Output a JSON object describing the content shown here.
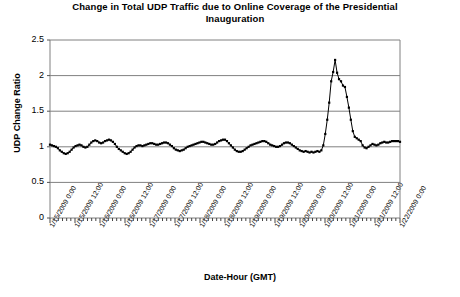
{
  "chart_data": {
    "type": "line",
    "title": "Change in Total UDP Traffic due to Online Coverage of the Presidential Inauguration",
    "title_line1": "Change in Total UDP Traffic due to Online Coverage of the Presidential",
    "title_line2": "Inauguration",
    "xlabel": "Date-Hour (GMT)",
    "ylabel": "UDP Change Ratio",
    "ylim": [
      0,
      2.5
    ],
    "ytick_labels": [
      "0",
      "0.5",
      "1",
      "1.5",
      "2",
      "2.5"
    ],
    "ytick_values": [
      0,
      0.5,
      1,
      1.5,
      2,
      2.5
    ],
    "grid": "horizontal",
    "legend": "none",
    "marker": "filled-diamond",
    "line_color": "#000000",
    "grid_color": "#808080",
    "axis_color": "#808080",
    "xtick_labels": [
      "1/15/2009 0:00",
      "1/15/2009 12:00",
      "1/16/2009 0:00",
      "1/16/2009 12:00",
      "1/17/2009 0:00",
      "1/17/2009 12:00",
      "1/18/2009 0:00",
      "1/18/2009 12:00",
      "1/19/2009 0:00",
      "1/19/2009 12:00",
      "1/20/2009 0:00",
      "1/20/2009 12:00",
      "1/21/2009 0:00",
      "1/21/2009 12:00",
      "1/22/2009 0:00"
    ],
    "xlim_hours": [
      0,
      168
    ],
    "xtick_interval_hours": 12,
    "minor_tick_interval_hours": 2,
    "x_start": "1/15/2009 0:00",
    "x_end": "1/22/2009 0:00",
    "peak": {
      "x_label": "1/20/2009 ~17:00",
      "value": 2.22
    },
    "baseline_value": 1.0,
    "values": [
      1.03,
      1.02,
      1.01,
      1.0,
      0.98,
      0.95,
      0.93,
      0.91,
      0.9,
      0.91,
      0.93,
      0.96,
      0.99,
      1.01,
      1.02,
      1.03,
      1.02,
      1.0,
      0.99,
      1.0,
      1.03,
      1.06,
      1.08,
      1.09,
      1.08,
      1.06,
      1.05,
      1.06,
      1.08,
      1.09,
      1.1,
      1.09,
      1.07,
      1.04,
      1.0,
      0.97,
      0.95,
      0.93,
      0.91,
      0.9,
      0.91,
      0.93,
      0.96,
      0.99,
      1.01,
      1.02,
      1.02,
      1.01,
      1.02,
      1.03,
      1.04,
      1.05,
      1.05,
      1.04,
      1.03,
      1.03,
      1.04,
      1.05,
      1.06,
      1.06,
      1.05,
      1.03,
      1.01,
      0.98,
      0.96,
      0.95,
      0.94,
      0.95,
      0.96,
      0.98,
      1.0,
      1.01,
      1.02,
      1.03,
      1.04,
      1.05,
      1.06,
      1.07,
      1.07,
      1.06,
      1.05,
      1.04,
      1.03,
      1.03,
      1.04,
      1.06,
      1.08,
      1.09,
      1.1,
      1.1,
      1.08,
      1.05,
      1.02,
      0.99,
      0.96,
      0.94,
      0.93,
      0.93,
      0.94,
      0.96,
      0.98,
      1.0,
      1.02,
      1.03,
      1.04,
      1.05,
      1.06,
      1.07,
      1.08,
      1.08,
      1.07,
      1.05,
      1.03,
      1.02,
      1.01,
      1.0,
      1.0,
      1.01,
      1.03,
      1.05,
      1.06,
      1.06,
      1.05,
      1.03,
      1.01,
      0.99,
      0.97,
      0.95,
      0.94,
      0.93,
      0.94,
      0.93,
      0.92,
      0.93,
      0.92,
      0.93,
      0.94,
      0.93,
      0.95,
      1.02,
      1.18,
      1.38,
      1.62,
      1.92,
      2.05,
      2.22,
      2.04,
      1.95,
      1.92,
      1.86,
      1.84,
      1.7,
      1.55,
      1.38,
      1.22,
      1.14,
      1.12,
      1.1,
      1.08,
      1.02,
      0.99,
      0.98,
      1.0,
      1.02,
      1.04,
      1.03,
      1.02,
      1.03,
      1.05,
      1.06,
      1.07,
      1.06,
      1.06,
      1.07,
      1.08,
      1.08,
      1.08,
      1.08,
      1.07
    ]
  }
}
